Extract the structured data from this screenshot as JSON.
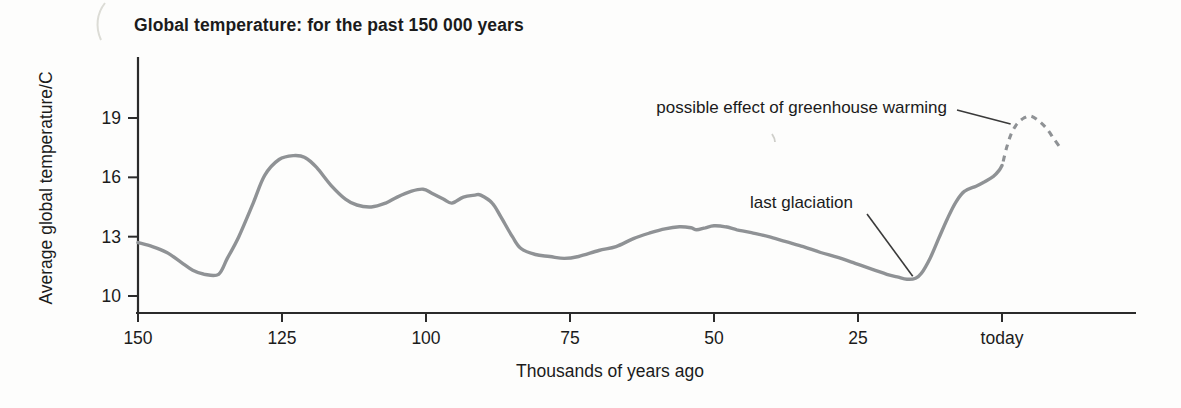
{
  "chart_data": {
    "type": "line",
    "title": "Global temperature: for the past 150 000 years",
    "xlabel": "Thousands of years ago",
    "ylabel": "Average global temperature/C",
    "x_unit": "thousands of years ago (0 = today; negative = projection drawn beyond today)",
    "y_unit": "degrees C",
    "x_axis_reversed": true,
    "xlim_kyr_ago": [
      150,
      -23
    ],
    "ylim_c": [
      9.5,
      20.5
    ],
    "grid": false,
    "legend": "none",
    "curve_color": "#8f9295",
    "axis_color": "#2b2b2b",
    "x_ticks": [
      {
        "value": 150,
        "label": "150"
      },
      {
        "value": 125,
        "label": "125"
      },
      {
        "value": 100,
        "label": "100"
      },
      {
        "value": 75,
        "label": "75"
      },
      {
        "value": 50,
        "label": "50"
      },
      {
        "value": 25,
        "label": "25"
      },
      {
        "value": 0,
        "label": "today"
      }
    ],
    "y_ticks": [
      {
        "value": 19,
        "label": "19"
      },
      {
        "value": 16,
        "label": "16"
      },
      {
        "value": 13,
        "label": "13"
      },
      {
        "value": 10,
        "label": "10"
      }
    ],
    "series": [
      {
        "name": "average global temperature (observed record)",
        "style": "solid",
        "points": [
          [
            150,
            12.7
          ],
          [
            147.5,
            12.5
          ],
          [
            145,
            12.2
          ],
          [
            142.5,
            11.7
          ],
          [
            140.5,
            11.3
          ],
          [
            138.5,
            11.1
          ],
          [
            136,
            11.1
          ],
          [
            134.5,
            11.9
          ],
          [
            132.5,
            13.0
          ],
          [
            130,
            14.7
          ],
          [
            128,
            16.1
          ],
          [
            125.5,
            16.9
          ],
          [
            123,
            17.1
          ],
          [
            121,
            17.0
          ],
          [
            119,
            16.5
          ],
          [
            116.5,
            15.6
          ],
          [
            114,
            14.9
          ],
          [
            112,
            14.6
          ],
          [
            109.5,
            14.5
          ],
          [
            107,
            14.7
          ],
          [
            105,
            15.0
          ],
          [
            102.5,
            15.3
          ],
          [
            100.5,
            15.4
          ],
          [
            99,
            15.2
          ],
          [
            97,
            14.9
          ],
          [
            95.5,
            14.7
          ],
          [
            93.5,
            15.0
          ],
          [
            91.5,
            15.1
          ],
          [
            90.5,
            15.1
          ],
          [
            88.5,
            14.7
          ],
          [
            87,
            14.0
          ],
          [
            85,
            13.0
          ],
          [
            83.5,
            12.4
          ],
          [
            81,
            12.1
          ],
          [
            78.5,
            12.0
          ],
          [
            76,
            11.9
          ],
          [
            73.5,
            12.0
          ],
          [
            70,
            12.3
          ],
          [
            67,
            12.5
          ],
          [
            64,
            12.9
          ],
          [
            61,
            13.2
          ],
          [
            58.5,
            13.4
          ],
          [
            56,
            13.5
          ],
          [
            54,
            13.45
          ],
          [
            53,
            13.35
          ],
          [
            51.5,
            13.45
          ],
          [
            50,
            13.55
          ],
          [
            48,
            13.5
          ],
          [
            46,
            13.35
          ],
          [
            43.5,
            13.2
          ],
          [
            40.5,
            13.0
          ],
          [
            37.5,
            12.75
          ],
          [
            34.5,
            12.5
          ],
          [
            31.5,
            12.2
          ],
          [
            28.5,
            11.95
          ],
          [
            25.5,
            11.65
          ],
          [
            22.5,
            11.35
          ],
          [
            20,
            11.1
          ],
          [
            18,
            10.95
          ],
          [
            16.5,
            10.85
          ],
          [
            15,
            10.9
          ],
          [
            14,
            11.15
          ],
          [
            12.5,
            11.9
          ],
          [
            11,
            12.9
          ],
          [
            9.5,
            13.9
          ],
          [
            8,
            14.75
          ],
          [
            6.5,
            15.3
          ],
          [
            4.5,
            15.55
          ],
          [
            3,
            15.78
          ],
          [
            1.5,
            16.05
          ],
          [
            0.5,
            16.35
          ],
          [
            0,
            16.6
          ]
        ]
      },
      {
        "name": "possible effect of greenhouse warming (projection)",
        "style": "dashed",
        "points": [
          [
            -0.2,
            16.8
          ],
          [
            -0.8,
            17.5
          ],
          [
            -1.6,
            18.2
          ],
          [
            -2.6,
            18.7
          ],
          [
            -3.8,
            19.0
          ],
          [
            -5,
            19.1
          ],
          [
            -6.4,
            18.85
          ],
          [
            -7.8,
            18.45
          ],
          [
            -9,
            17.95
          ],
          [
            -10,
            17.55
          ]
        ]
      }
    ],
    "annotations": [
      {
        "label": "possible effect of greenhouse warming",
        "target": {
          "kyr": -1.5,
          "temp_c": 18.7
        },
        "note": "leader line points to the dashed projected peak of about 19 C just beyond today"
      },
      {
        "label": "last glaciation",
        "target": {
          "kyr": 15.5,
          "temp_c": 11.0
        },
        "note": "leader line points to the temperature minimum of about 11 C roughly 15 000 years ago"
      }
    ]
  }
}
